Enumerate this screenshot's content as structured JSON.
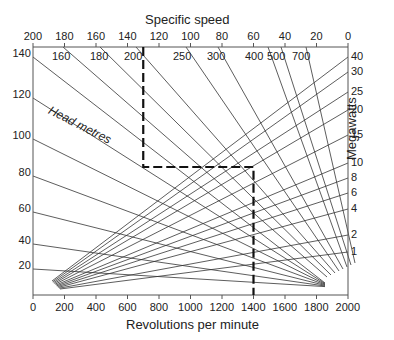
{
  "chart_data": {
    "type": "nomogram",
    "top_axis": {
      "label": "Specific speed",
      "ticks": [
        200,
        180,
        160,
        140,
        120,
        100,
        80,
        60,
        40,
        20,
        0
      ]
    },
    "bottom_axis": {
      "label": "Revolutions per minute",
      "ticks": [
        0,
        200,
        400,
        600,
        800,
        1000,
        1200,
        1400,
        1600,
        1800,
        2000
      ]
    },
    "left_axis": {
      "label": "Head metres",
      "ticks": [
        140,
        120,
        100,
        80,
        60,
        40,
        20
      ]
    },
    "right_axis": {
      "label": "Megawatts",
      "ticks": [
        40,
        30,
        25,
        20,
        15,
        10,
        8,
        6,
        4,
        2,
        1
      ]
    },
    "specific_speed_lines": [
      160,
      180,
      200,
      250,
      300,
      400,
      500,
      700
    ],
    "example_path": {
      "style": "dashed",
      "specific_speed": 130,
      "rpm": 1400
    }
  },
  "labels": {
    "top_title": "Specific speed",
    "bottom_title": "Revolutions per minute",
    "right_title": "Megawatts",
    "head_label": "Head metres"
  }
}
